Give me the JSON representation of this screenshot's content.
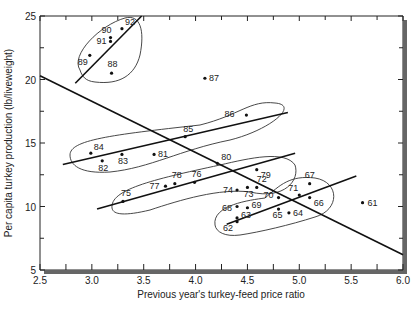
{
  "chart_data": {
    "type": "scatter",
    "title": "",
    "xlabel": "Previous year's turkey-feed price ratio",
    "ylabel": "Per capita turkey production (lb/liveweight)",
    "xlim": [
      2.5,
      6.0
    ],
    "ylim": [
      5,
      25
    ],
    "xticks": [
      "2.5",
      "3.0",
      "3.5",
      "4.0",
      "4.5",
      "5.0",
      "5.5",
      "6.0"
    ],
    "yticks": [
      "5",
      "10",
      "15",
      "20",
      "25"
    ],
    "grid": false,
    "points": [
      {
        "label": "92",
        "x": 3.29,
        "y": 24.0
      },
      {
        "label": "90",
        "x": 3.18,
        "y": 23.3
      },
      {
        "label": "91",
        "x": 3.18,
        "y": 23.0
      },
      {
        "label": "89",
        "x": 2.98,
        "y": 21.9
      },
      {
        "label": "88",
        "x": 3.19,
        "y": 20.5
      },
      {
        "label": "87",
        "x": 4.09,
        "y": 20.1
      },
      {
        "label": "86",
        "x": 4.49,
        "y": 17.2
      },
      {
        "label": "85",
        "x": 3.9,
        "y": 15.5
      },
      {
        "label": "84",
        "x": 2.99,
        "y": 14.2
      },
      {
        "label": "83",
        "x": 3.29,
        "y": 14.1
      },
      {
        "label": "82",
        "x": 3.1,
        "y": 13.6
      },
      {
        "label": "81",
        "x": 3.6,
        "y": 14.1
      },
      {
        "label": "80",
        "x": 4.21,
        "y": 13.4
      },
      {
        "label": "79",
        "x": 4.59,
        "y": 12.9
      },
      {
        "label": "78",
        "x": 3.8,
        "y": 11.8
      },
      {
        "label": "77",
        "x": 3.71,
        "y": 11.6
      },
      {
        "label": "76",
        "x": 3.99,
        "y": 11.9
      },
      {
        "label": "75",
        "x": 3.3,
        "y": 10.4
      },
      {
        "label": "74",
        "x": 4.4,
        "y": 11.3
      },
      {
        "label": "73",
        "x": 4.5,
        "y": 11.5
      },
      {
        "label": "72",
        "x": 4.59,
        "y": 11.5
      },
      {
        "label": "71",
        "x": 5.0,
        "y": 10.9
      },
      {
        "label": "70",
        "x": 4.8,
        "y": 10.7
      },
      {
        "label": "69",
        "x": 4.5,
        "y": 9.9
      },
      {
        "label": "68",
        "x": 4.4,
        "y": 10.0
      },
      {
        "label": "67",
        "x": 5.1,
        "y": 11.8
      },
      {
        "label": "66",
        "x": 5.1,
        "y": 10.7
      },
      {
        "label": "65",
        "x": 4.8,
        "y": 9.8
      },
      {
        "label": "64",
        "x": 4.9,
        "y": 9.5
      },
      {
        "label": "63",
        "x": 4.4,
        "y": 9.1
      },
      {
        "label": "62",
        "x": 4.4,
        "y": 8.8
      },
      {
        "label": "61",
        "x": 5.61,
        "y": 10.3
      }
    ],
    "lines": [
      {
        "name": "overall-fit",
        "x": [
          2.5,
          6.0
        ],
        "y": [
          20.3,
          6.2
        ]
      },
      {
        "name": "group-88-92-fit",
        "x": [
          2.84,
          3.48
        ],
        "y": [
          19.7,
          25.0
        ]
      },
      {
        "name": "group-81-86-fit",
        "x": [
          2.72,
          4.89
        ],
        "y": [
          13.3,
          17.4
        ]
      },
      {
        "name": "group-75-80-fit",
        "x": [
          3.05,
          4.96
        ],
        "y": [
          9.8,
          14.2
        ]
      },
      {
        "name": "group-61-71-fit",
        "x": [
          4.3,
          5.55
        ],
        "y": [
          8.6,
          12.4
        ]
      }
    ],
    "annotations": "Points labeled by year (61-92); ellipses enclose year groups 88-92, 81-86, 75-80, 61-74"
  }
}
